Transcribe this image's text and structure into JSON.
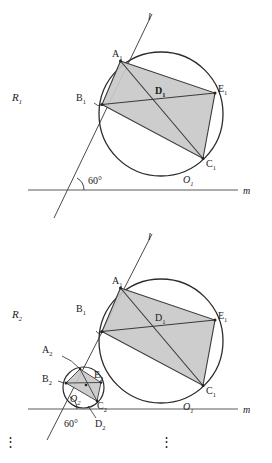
{
  "figure": {
    "colors": {
      "stroke": "#2b2b2b",
      "shade_fill": "#c9c9c9",
      "shade_stroke": "#3a3a3a",
      "baseline": "#5a5a5a",
      "label": "#1a1a1a"
    },
    "angle_label": "60°",
    "line_l_label": "l",
    "line_m_label": "m",
    "ellipsis": "⋮"
  },
  "panel1": {
    "region_label": "R",
    "region_sub": "1",
    "angle": "60°",
    "line_l": "l",
    "line_m": "m",
    "points": [
      {
        "name": "A",
        "sub": "1",
        "x": 120.5,
        "y": 61.0,
        "label_x": 113,
        "label_y": 57
      },
      {
        "name": "B",
        "sub": "1",
        "x": 102.0,
        "y": 104.5,
        "label_x": 78,
        "label_y": 101
      },
      {
        "name": "C",
        "sub": "1",
        "x": 203.0,
        "y": 158.5,
        "label_x": 207,
        "label_y": 166
      },
      {
        "name": "D",
        "sub": "1",
        "x": 163.5,
        "y": 98.0,
        "label_x": 157,
        "label_y": 94
      },
      {
        "name": "E",
        "sub": "1",
        "x": 215.0,
        "y": 93.0,
        "label_x": 219,
        "label_y": 92
      },
      {
        "name": "O",
        "sub": "1",
        "x": 161.0,
        "y": 114.0,
        "label_x": 186,
        "label_y": 182
      }
    ],
    "circle": {
      "cx": 161.0,
      "cy": 114.0,
      "r": 62.0
    }
  },
  "panel2": {
    "region_label": "R",
    "region_sub": "2",
    "angle": "60°",
    "line_l": "l",
    "line_m": "m",
    "big_circle": {
      "cx": 161.0,
      "cy": 341.0,
      "r": 62.0
    },
    "small_circle": {
      "cx": 83.5,
      "cy": 387.5,
      "r": 20.5
    },
    "points_big": [
      {
        "name": "A",
        "sub": "1",
        "x": 120.5,
        "y": 288.0,
        "label_x": 113,
        "label_y": 284
      },
      {
        "name": "B",
        "sub": "1",
        "x": 102.0,
        "y": 331.5,
        "label_x": 78,
        "label_y": 312
      },
      {
        "name": "C",
        "sub": "1",
        "x": 203.0,
        "y": 385.5,
        "label_x": 207,
        "label_y": 393
      },
      {
        "name": "D",
        "sub": "1",
        "x": 163.5,
        "y": 325.0,
        "label_x": 157,
        "label_y": 321
      },
      {
        "name": "E",
        "sub": "1",
        "x": 215.0,
        "y": 320.0,
        "label_x": 219,
        "label_y": 319
      },
      {
        "name": "O",
        "sub": "1",
        "x": 161.0,
        "y": 341.0,
        "label_x": 186,
        "label_y": 409
      }
    ],
    "points_small": [
      {
        "name": "A",
        "sub": "2",
        "x": 80.0,
        "y": 369.0,
        "label_x": 44,
        "label_y": 353
      },
      {
        "name": "B",
        "sub": "2",
        "x": 66.0,
        "y": 383.0,
        "label_x": 45,
        "label_y": 381
      },
      {
        "name": "C",
        "sub": "2",
        "x": 97.0,
        "y": 401.0,
        "label_x": 98,
        "label_y": 409
      },
      {
        "name": "D",
        "sub": "2",
        "x": 87.0,
        "y": 405.0,
        "label_x": 97,
        "label_y": 424
      },
      {
        "name": "E",
        "sub": "2",
        "x": 101.0,
        "y": 382.5,
        "label_x": 96,
        "label_y": 378
      },
      {
        "name": "O",
        "sub": "2",
        "x": 83.5,
        "y": 387.5,
        "label_x": 72,
        "label_y": 401
      }
    ]
  }
}
